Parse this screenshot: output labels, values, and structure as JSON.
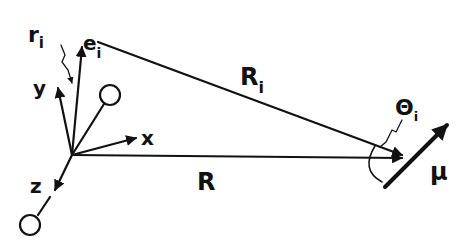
{
  "diagram": {
    "type": "vector geometry diagram",
    "colors": {
      "ink": "#111111",
      "background": "#ffffff"
    },
    "labels": {
      "r_i": {
        "base": "r",
        "sub": "i"
      },
      "e_i": {
        "base": "e",
        "sub": "i"
      },
      "y_axis": "y",
      "x_axis": "x",
      "z_axis": "z",
      "R_i": {
        "base": "R",
        "sub": "i"
      },
      "R": "R",
      "theta_i": {
        "base": "Θ",
        "sub": "i"
      },
      "mu": "μ"
    }
  }
}
